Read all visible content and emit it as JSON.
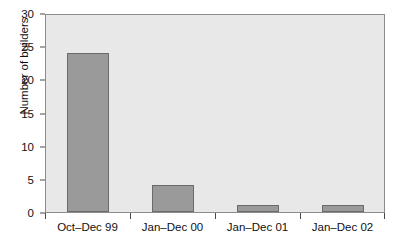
{
  "chart_data": {
    "type": "bar",
    "title": "",
    "xlabel": "",
    "ylabel": "Number of builders",
    "categories": [
      "Oct–Dec 99",
      "Jan–Dec 00",
      "Jan–Dec 01",
      "Jan–Dec 02"
    ],
    "values": [
      24,
      4,
      1,
      1
    ],
    "ylim": [
      0,
      30
    ],
    "yticks": [
      0,
      5,
      10,
      15,
      20,
      25,
      30
    ],
    "ytick_labels": [
      "0",
      "5",
      "10",
      "15",
      "20",
      "25",
      "30"
    ],
    "grid": false,
    "legend": null,
    "bar_color": "#9a9a9a",
    "bar_edge_color": "#6b6b6b",
    "plot_background": "#e8e8e8",
    "axis_color": "#4a4a4a",
    "figure_background": "#ffffff"
  }
}
